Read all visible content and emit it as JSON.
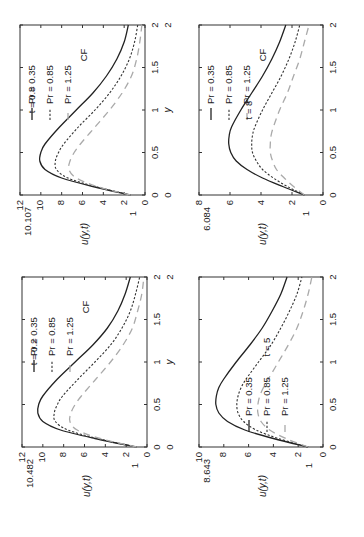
{
  "figure": {
    "orientation": "rotated-90-ccw",
    "x_axis_label": "y",
    "y_axis_label": "u(y,t)",
    "legend_extra": "CF"
  },
  "chart_data": [
    {
      "type": "line",
      "panel": "top-left",
      "time_label": "t = 0.8",
      "peak_label": "10.107",
      "xlabel": "y",
      "ylabel": "u(y,t)",
      "xlim": [
        0,
        2
      ],
      "ylim": [
        0,
        12
      ],
      "xticks": [
        "0",
        "0.5",
        "1",
        "1.5",
        "2"
      ],
      "yticks": [
        "0",
        "2",
        "4",
        "6",
        "8",
        "10",
        "12"
      ],
      "extra_ytick": "1",
      "legend": [
        "Pr = 0.35",
        "Pr = 0.85",
        "Pr = 1.25",
        "CF"
      ],
      "x": [
        0,
        0.1,
        0.2,
        0.3,
        0.4,
        0.5,
        0.6,
        0.8,
        1.0,
        1.2,
        1.4,
        1.6,
        1.8,
        2.0
      ],
      "series": [
        {
          "name": "Pr = 0.35",
          "style": "solid",
          "values": [
            1.4,
            5.0,
            8.0,
            9.6,
            10.1,
            10.0,
            9.6,
            8.2,
            6.6,
            5.0,
            3.7,
            2.7,
            2.0,
            1.6
          ]
        },
        {
          "name": "Pr = 0.85",
          "style": "dotted",
          "values": [
            1.4,
            4.8,
            7.4,
            8.5,
            8.6,
            8.3,
            7.8,
            6.4,
            4.8,
            3.4,
            2.3,
            1.5,
            1.0,
            0.7
          ]
        },
        {
          "name": "Pr = 1.25",
          "style": "dashed-gray",
          "values": [
            1.4,
            4.6,
            6.6,
            7.3,
            7.2,
            6.8,
            6.2,
            4.8,
            3.4,
            2.2,
            1.3,
            0.8,
            0.5,
            0.3
          ]
        }
      ]
    },
    {
      "type": "line",
      "panel": "top-right",
      "time_label": "t = 8",
      "peak_label": "6.084",
      "xlabel": "y",
      "ylabel": "u(y,t)",
      "xlim": [
        0,
        2
      ],
      "ylim": [
        0,
        8
      ],
      "xticks": [
        "0",
        "0.5",
        "1",
        "1.5",
        "2"
      ],
      "yticks": [
        "0",
        "2",
        "4",
        "6",
        "8"
      ],
      "extra_ytick": "1",
      "legend": [
        "Pr = 0.35",
        "Pr = 0.85",
        "Pr = 1.25",
        "CF"
      ],
      "x": [
        0,
        0.1,
        0.2,
        0.3,
        0.4,
        0.5,
        0.6,
        0.7,
        0.8,
        1.0,
        1.2,
        1.4,
        1.6,
        1.8,
        2.0
      ],
      "series": [
        {
          "name": "Pr = 0.35",
          "style": "solid",
          "values": [
            1.2,
            2.6,
            3.9,
            4.9,
            5.6,
            5.95,
            6.08,
            6.05,
            5.9,
            5.3,
            4.6,
            3.9,
            3.3,
            2.8,
            2.4
          ]
        },
        {
          "name": "Pr = 0.85",
          "style": "dotted",
          "values": [
            1.2,
            2.3,
            3.2,
            3.9,
            4.3,
            4.55,
            4.6,
            4.55,
            4.4,
            3.9,
            3.3,
            2.7,
            2.2,
            1.8,
            1.5
          ]
        },
        {
          "name": "Pr = 1.25",
          "style": "dashed-gray",
          "values": [
            1.2,
            1.9,
            2.5,
            3.0,
            3.25,
            3.4,
            3.4,
            3.35,
            3.2,
            2.8,
            2.3,
            1.9,
            1.5,
            1.2,
            0.9
          ]
        }
      ]
    },
    {
      "type": "line",
      "panel": "bottom-left",
      "time_label": "t = 0.2",
      "peak_label": "10.482",
      "xlabel": "y",
      "ylabel": "u(y,t)",
      "xlim": [
        0,
        2
      ],
      "ylim": [
        0,
        12
      ],
      "xticks": [
        "0",
        "0.5",
        "1",
        "1.5",
        "2"
      ],
      "yticks": [
        "0",
        "2",
        "4",
        "6",
        "8",
        "10",
        "12"
      ],
      "extra_ytick": "1",
      "legend": [
        "Pr = 0.35",
        "Pr = 0.85",
        "Pr = 1.25",
        "CF"
      ],
      "x": [
        0,
        0.1,
        0.2,
        0.3,
        0.4,
        0.5,
        0.6,
        0.8,
        1.0,
        1.2,
        1.4,
        1.6,
        1.8,
        2.0
      ],
      "series": [
        {
          "name": "Pr = 0.35",
          "style": "solid",
          "values": [
            1.0,
            5.0,
            8.3,
            10.0,
            10.48,
            10.4,
            10.0,
            8.6,
            6.9,
            5.2,
            3.8,
            2.8,
            2.1,
            1.6
          ]
        },
        {
          "name": "Pr = 0.85",
          "style": "dotted",
          "values": [
            1.0,
            4.8,
            7.6,
            8.8,
            8.9,
            8.6,
            8.1,
            6.6,
            5.0,
            3.5,
            2.4,
            1.6,
            1.1,
            0.7
          ]
        },
        {
          "name": "Pr = 1.25",
          "style": "dashed-gray",
          "values": [
            1.0,
            4.5,
            6.7,
            7.4,
            7.3,
            6.9,
            6.3,
            4.9,
            3.5,
            2.3,
            1.4,
            0.9,
            0.5,
            0.3
          ]
        }
      ]
    },
    {
      "type": "line",
      "panel": "bottom-right",
      "time_label": "t = 5",
      "peak_label": "8.643",
      "xlabel": "y",
      "ylabel": "u(y,t)",
      "xlim": [
        0,
        2
      ],
      "ylim": [
        0,
        10
      ],
      "xticks": [
        "0",
        "0.5",
        "1",
        "1.5",
        "2"
      ],
      "yticks": [
        "0",
        "2",
        "4",
        "6",
        "8",
        "10"
      ],
      "extra_ytick": "1",
      "legend": [
        "Pr = 0.35",
        "Pr = 0.85",
        "Pr = 1.25"
      ],
      "x": [
        0,
        0.1,
        0.2,
        0.3,
        0.4,
        0.5,
        0.6,
        0.7,
        0.8,
        1.0,
        1.2,
        1.4,
        1.6,
        1.8,
        2.0
      ],
      "series": [
        {
          "name": "Pr = 0.35",
          "style": "solid",
          "values": [
            1.2,
            4.0,
            6.3,
            7.7,
            8.4,
            8.64,
            8.6,
            8.4,
            8.0,
            7.0,
            5.9,
            4.9,
            4.1,
            3.4,
            2.9
          ]
        },
        {
          "name": "Pr = 0.85",
          "style": "dotted",
          "values": [
            1.2,
            3.6,
            5.4,
            6.4,
            6.85,
            6.95,
            6.85,
            6.6,
            6.2,
            5.2,
            4.2,
            3.4,
            2.7,
            2.1,
            1.7
          ]
        },
        {
          "name": "Pr = 1.25",
          "style": "dashed-gray",
          "values": [
            1.2,
            3.0,
            4.3,
            5.0,
            5.25,
            5.25,
            5.1,
            4.8,
            4.4,
            3.6,
            2.8,
            2.1,
            1.6,
            1.2,
            0.9
          ]
        }
      ]
    }
  ]
}
